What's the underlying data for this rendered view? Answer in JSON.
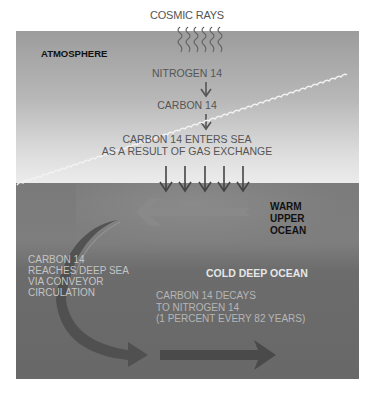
{
  "diagram": {
    "title_top": "COSMIC RAYS",
    "regions": {
      "atmosphere": "ATMOSPHERE",
      "warm_upper_ocean": [
        "WARM",
        "UPPER",
        "OCEAN"
      ],
      "cold_deep_ocean": "COLD DEEP OCEAN"
    },
    "steps": {
      "nitrogen": "NITROGEN 14",
      "carbon": "CARBON 14",
      "enters_sea": [
        "CARBON 14 ENTERS SEA",
        "AS A RESULT OF GAS EXCHANGE"
      ]
    },
    "deep_sea": [
      "CARBON 14",
      "REACHES DEEP SEA",
      "VIA CONVEYOR",
      "CIRCULATION"
    ],
    "decay": [
      "CARBON 14 DECAYS",
      "TO NITROGEN 14",
      "(1 PERCENT EVERY 82 YEARS)"
    ],
    "icons": {
      "cosmic_rays": "wavy-rays-icon",
      "down_arrow": "arrow-down-icon",
      "gas_exchange_arrows": "arrow-down-icon",
      "upper_flow": "arrow-left-icon",
      "sinking_flow": "curved-arrow-icon",
      "deep_flow": "arrow-right-icon",
      "waves": "wave-icon"
    },
    "colors": {
      "atmosphere_top": "#9c9c9c",
      "atmosphere_bottom": "#ececec",
      "ocean": "#6c6c6c",
      "dark_arrow": "#4a4a4a",
      "light_arrow": "#8c8c8c"
    }
  }
}
